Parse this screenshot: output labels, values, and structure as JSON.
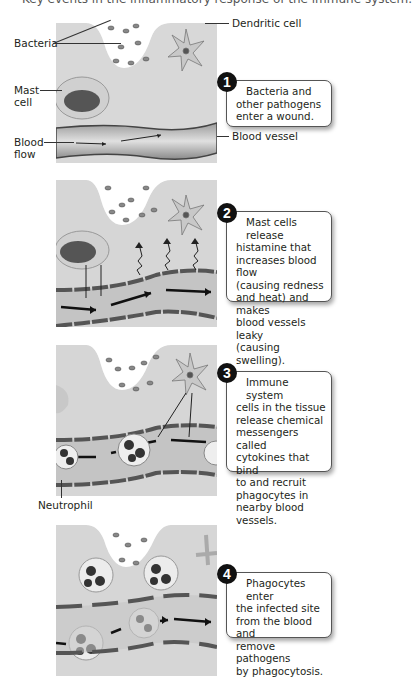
{
  "top_caption_fragment": "Key events in the inflammatory response of the immune system.",
  "panel1": {
    "labels": {
      "bacteria": "Bacteria",
      "dendritic_cell": "Dendritic cell",
      "mast_cell_line1": "Mast",
      "mast_cell_line2": "cell",
      "blood_flow_line1": "Blood",
      "blood_flow_line2": "flow",
      "blood_vessel": "Blood vessel"
    },
    "step": "1",
    "lines": [
      "Bacteria and",
      "other pathogens",
      "enter a wound."
    ]
  },
  "panel2": {
    "step": "2",
    "lines": [
      "Mast cells release",
      "histamine that",
      "increases blood flow",
      "(causing redness",
      "and heat) and makes",
      "blood vessels leaky",
      "(causing swelling)."
    ]
  },
  "panel3": {
    "labels": {
      "neutrophil": "Neutrophil"
    },
    "step": "3",
    "lines": [
      "Immune system",
      "cells in the tissue",
      "release chemical",
      "messengers called",
      "cytokines that bind",
      "to and recruit",
      "phagocytes in",
      "nearby blood vessels."
    ]
  },
  "panel4": {
    "step": "4",
    "lines": [
      "Phagocytes enter",
      "the infected site",
      "from the blood and",
      "remove pathogens",
      "by phagocytosis."
    ]
  },
  "colors": {
    "tissue": "#d6d6d6",
    "vessel_wall": "#555555",
    "vessel_lumen": "#bdbdbd",
    "step_circle": "#111111",
    "callout_border": "#555555"
  }
}
